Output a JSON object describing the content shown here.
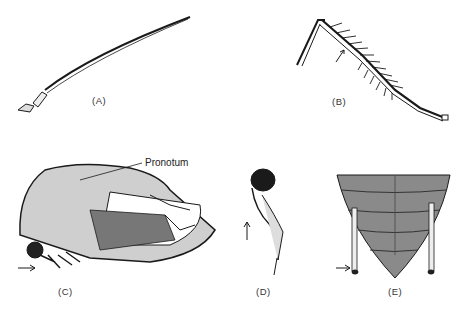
{
  "figure": {
    "panels": [
      {
        "id": "A",
        "label": "(A)",
        "subject": "antenna"
      },
      {
        "id": "B",
        "label": "(B)",
        "subject": "hind leg with spines"
      },
      {
        "id": "C",
        "label": "(C)",
        "subject": "treehopper lateral view"
      },
      {
        "id": "D",
        "label": "(D)",
        "subject": "head and beak"
      },
      {
        "id": "E",
        "label": "(E)",
        "subject": "abdomen tip with cornicles"
      }
    ],
    "annotations": {
      "pronotum": "Pronotum"
    },
    "colors": {
      "ink": "#1a1a1a",
      "background": "#ffffff",
      "shade": "#6a6a6a"
    }
  }
}
